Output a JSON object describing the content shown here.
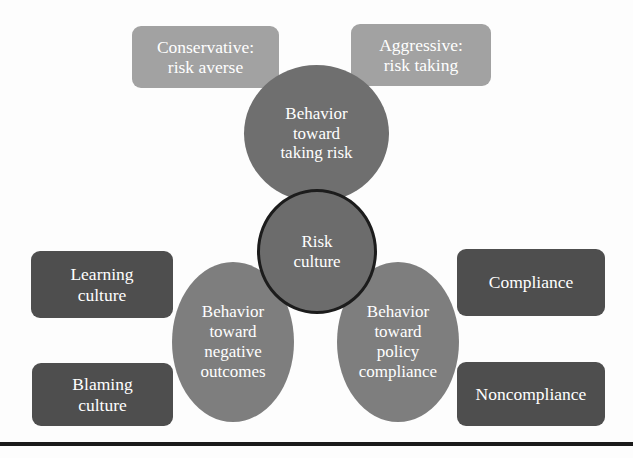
{
  "diagram": {
    "background_color": "#fdfdfd",
    "rule_color": "#1a1a1a",
    "core": {
      "label": "Risk\nculture",
      "fill": "#6c6c6c",
      "stroke": "#1c1c1c",
      "text_color": "#ffffff"
    },
    "dimensions": [
      {
        "id": "taking-risk",
        "label": "Behavior\ntoward\ntaking risk",
        "fill": "#6f6f6f",
        "position": "top",
        "endpoints": [
          {
            "id": "conservative",
            "label": "Conservative:\nrisk averse",
            "fill": "#a2a2a2",
            "side": "left"
          },
          {
            "id": "aggressive",
            "label": "Aggressive:\nrisk taking",
            "fill": "#a2a2a2",
            "side": "right"
          }
        ]
      },
      {
        "id": "negative-outcomes",
        "label": "Behavior\ntoward\nnegative\noutcomes",
        "fill": "#7e7e7e",
        "position": "bottom-left",
        "endpoints": [
          {
            "id": "learning-culture",
            "label": "Learning\nculture",
            "fill": "#4e4e4e",
            "side": "upper-left"
          },
          {
            "id": "blaming-culture",
            "label": "Blaming\nculture",
            "fill": "#4e4e4e",
            "side": "lower-left"
          }
        ]
      },
      {
        "id": "policy-compliance",
        "label": "Behavior\ntoward\npolicy\ncompliance",
        "fill": "#7e7e7e",
        "position": "bottom-right",
        "endpoints": [
          {
            "id": "compliance",
            "label": "Compliance",
            "fill": "#4e4e4e",
            "side": "upper-right"
          },
          {
            "id": "noncompliance",
            "label": "Noncompliance",
            "fill": "#4e4e4e",
            "side": "lower-right"
          }
        ]
      }
    ]
  }
}
